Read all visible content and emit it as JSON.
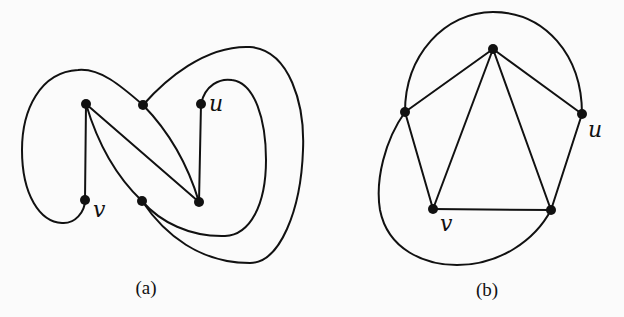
{
  "figure": {
    "panels": [
      {
        "id": "a",
        "caption": "(a)",
        "vertices": [
          {
            "id": "A",
            "x": 86,
            "y": 104,
            "label": ""
          },
          {
            "id": "B",
            "x": 143,
            "y": 105,
            "label": ""
          },
          {
            "id": "u",
            "x": 201,
            "y": 104,
            "label": "u"
          },
          {
            "id": "v",
            "x": 85,
            "y": 200,
            "label": "v"
          },
          {
            "id": "C",
            "x": 142,
            "y": 201,
            "label": ""
          },
          {
            "id": "D",
            "x": 199,
            "y": 202,
            "label": ""
          }
        ],
        "straight_edges": [
          [
            "A",
            "v"
          ],
          [
            "A",
            "D"
          ],
          [
            "u",
            "D"
          ]
        ],
        "curved_edges": [
          [
            "A",
            "C"
          ],
          [
            "B",
            "D"
          ],
          [
            "B",
            "v"
          ],
          [
            "B",
            "C"
          ],
          [
            "u",
            "C"
          ]
        ]
      },
      {
        "id": "b",
        "caption": "(b)",
        "vertices": [
          {
            "id": "T",
            "x": 493,
            "y": 49,
            "label": ""
          },
          {
            "id": "L",
            "x": 405,
            "y": 112,
            "label": ""
          },
          {
            "id": "u",
            "x": 582,
            "y": 114,
            "label": "u"
          },
          {
            "id": "v",
            "x": 433,
            "y": 209,
            "label": "v"
          },
          {
            "id": "R",
            "x": 551,
            "y": 210,
            "label": ""
          }
        ],
        "straight_edges": [
          [
            "T",
            "L"
          ],
          [
            "T",
            "u"
          ],
          [
            "T",
            "v"
          ],
          [
            "T",
            "R"
          ],
          [
            "L",
            "v"
          ],
          [
            "v",
            "R"
          ],
          [
            "u",
            "R"
          ]
        ],
        "curved_edges": [
          [
            "L",
            "u"
          ],
          [
            "L",
            "R"
          ]
        ]
      }
    ],
    "labels": {
      "a_u": "u",
      "a_v": "v",
      "b_u": "u",
      "b_v": "v"
    },
    "captions": {
      "a": "(a)",
      "b": "(b)"
    },
    "colors": {
      "ink": "#111111",
      "background": "#fbfbfb"
    }
  }
}
